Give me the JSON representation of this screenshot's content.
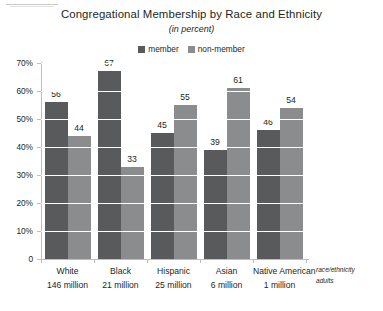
{
  "chart_data": {
    "type": "bar",
    "title": "Congregational Membership by Race and Ethnicity",
    "subtitle": "(in percent)",
    "xlabel": "race/ethnicity",
    "xlabel_line2": "adults",
    "ylabel": "",
    "ylim": [
      0,
      70
    ],
    "grid": true,
    "legend_position": "top-right",
    "categories": [
      "White",
      "Black",
      "Hispanic",
      "Asian",
      "Native American"
    ],
    "category_subtitles": [
      "146 million",
      "21 million",
      "25 million",
      "6 million",
      "1 million"
    ],
    "series": [
      {
        "name": "member",
        "color": "#595a5c",
        "values": [
          56,
          67,
          45,
          39,
          46
        ]
      },
      {
        "name": "non-member",
        "color": "#8b8c8e",
        "values": [
          44,
          33,
          55,
          61,
          54
        ]
      }
    ],
    "yticks": [
      "0",
      "10%",
      "20%",
      "30%",
      "40%",
      "50%",
      "60%",
      "70%"
    ],
    "ytick_values": [
      0,
      10,
      20,
      30,
      40,
      50,
      60,
      70
    ]
  },
  "colors": {
    "member": "#595a5c",
    "non_member": "#8b8c8e",
    "axis": "#bdbdbd",
    "text": "#231f20",
    "gridline": "#ffffff",
    "background": "#ffffff"
  }
}
